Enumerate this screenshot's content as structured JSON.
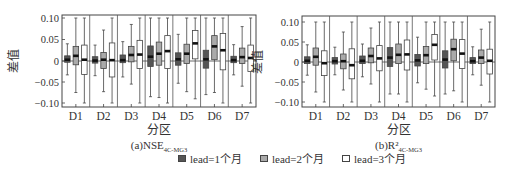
{
  "chart_data": [
    {
      "type": "box",
      "panel": "a",
      "title": "(a)NSE",
      "title_subscript": "4C-MG3",
      "xlabel": "分区",
      "ylabel": "差值",
      "ylim": [
        -0.11,
        0.11
      ],
      "yticks": [
        0.1,
        0.05,
        0,
        -0.05,
        -0.1
      ],
      "ytick_labels": [
        "0.10",
        "0.05",
        "0",
        "−0.05",
        "−0.10"
      ],
      "categories": [
        "D1",
        "D2",
        "D3",
        "D4",
        "D5",
        "D6",
        "D7"
      ],
      "reference_line": 0,
      "series": [
        {
          "name": "lead=1个月",
          "fill": "#555555",
          "boxes": [
            {
              "min": -0.033,
              "q1": -0.003,
              "median": 0.003,
              "q3": 0.012,
              "max": 0.04
            },
            {
              "min": -0.035,
              "q1": -0.005,
              "median": 0.001,
              "q3": 0.01,
              "max": 0.037
            },
            {
              "min": -0.038,
              "q1": -0.004,
              "median": 0.002,
              "q3": 0.014,
              "max": 0.045
            },
            {
              "min": -0.085,
              "q1": -0.013,
              "median": 0.01,
              "q3": 0.035,
              "max": 0.1
            },
            {
              "min": -0.053,
              "q1": -0.01,
              "median": 0.004,
              "q3": 0.019,
              "max": 0.062
            },
            {
              "min": -0.08,
              "q1": -0.017,
              "median": 0.004,
              "q3": 0.025,
              "max": 0.1
            },
            {
              "min": -0.033,
              "q1": -0.004,
              "median": 0.002,
              "q3": 0.011,
              "max": 0.038
            }
          ]
        },
        {
          "name": "lead=2个月",
          "fill": "#aaaaaa",
          "boxes": [
            {
              "min": -0.075,
              "q1": -0.009,
              "median": 0.012,
              "q3": 0.034,
              "max": 0.1
            },
            {
              "min": -0.073,
              "q1": -0.018,
              "median": 0.003,
              "q3": 0.02,
              "max": 0.072
            },
            {
              "min": -0.055,
              "q1": -0.002,
              "median": 0.014,
              "q3": 0.034,
              "max": 0.085
            },
            {
              "min": -0.087,
              "q1": -0.01,
              "median": 0.017,
              "q3": 0.044,
              "max": 0.1
            },
            {
              "min": -0.073,
              "q1": -0.006,
              "median": 0.017,
              "q3": 0.039,
              "max": 0.1
            },
            {
              "min": -0.075,
              "q1": 0.003,
              "median": 0.034,
              "q3": 0.059,
              "max": 0.1
            },
            {
              "min": -0.06,
              "q1": -0.006,
              "median": 0.009,
              "q3": 0.03,
              "max": 0.08
            }
          ]
        },
        {
          "name": "lead=3个月",
          "fill": "#ffffff",
          "boxes": [
            {
              "min": -0.1,
              "q1": -0.032,
              "median": 0.003,
              "q3": 0.037,
              "max": 0.1
            },
            {
              "min": -0.1,
              "q1": -0.038,
              "median": 0.002,
              "q3": 0.042,
              "max": 0.1
            },
            {
              "min": -0.1,
              "q1": -0.018,
              "median": 0.015,
              "q3": 0.048,
              "max": 0.1
            },
            {
              "min": -0.1,
              "q1": -0.018,
              "median": 0.023,
              "q3": 0.059,
              "max": 0.1
            },
            {
              "min": -0.09,
              "q1": 0.005,
              "median": 0.041,
              "q3": 0.071,
              "max": 0.1
            },
            {
              "min": -0.1,
              "q1": -0.021,
              "median": 0.025,
              "q3": 0.064,
              "max": 0.1
            },
            {
              "min": -0.1,
              "q1": -0.025,
              "median": 0.007,
              "q3": 0.037,
              "max": 0.1
            }
          ]
        }
      ]
    },
    {
      "type": "box",
      "panel": "b",
      "title": "(b)R²",
      "title_subscript": "4C-MG3",
      "xlabel": "分区",
      "ylabel": "差值",
      "ylim": [
        -0.11,
        0.11
      ],
      "yticks": [
        0.1,
        0.05,
        0,
        -0.05,
        -0.1
      ],
      "ytick_labels": [
        "0.10",
        "0.05",
        "0",
        "−0.05",
        "−0.10"
      ],
      "categories": [
        "D1",
        "D2",
        "D3",
        "D4",
        "D5",
        "D6",
        "D7"
      ],
      "reference_line": 0,
      "series": [
        {
          "name": "lead=1个月",
          "fill": "#555555",
          "boxes": [
            {
              "min": -0.033,
              "q1": -0.004,
              "median": 0.003,
              "q3": 0.013,
              "max": 0.043
            },
            {
              "min": -0.032,
              "q1": -0.005,
              "median": 0.002,
              "q3": 0.011,
              "max": 0.037
            },
            {
              "min": -0.037,
              "q1": -0.004,
              "median": 0.003,
              "q3": 0.015,
              "max": 0.045
            },
            {
              "min": -0.08,
              "q1": -0.011,
              "median": 0.011,
              "q3": 0.036,
              "max": 0.1
            },
            {
              "min": -0.052,
              "q1": -0.01,
              "median": 0.004,
              "q3": 0.019,
              "max": 0.062
            },
            {
              "min": -0.08,
              "q1": -0.015,
              "median": 0.006,
              "q3": 0.028,
              "max": 0.1
            },
            {
              "min": -0.032,
              "q1": -0.004,
              "median": 0.002,
              "q3": 0.011,
              "max": 0.038
            }
          ]
        },
        {
          "name": "lead=2个月",
          "fill": "#aaaaaa",
          "boxes": [
            {
              "min": -0.075,
              "q1": -0.008,
              "median": 0.013,
              "q3": 0.035,
              "max": 0.1
            },
            {
              "min": -0.07,
              "q1": -0.017,
              "median": 0.002,
              "q3": 0.02,
              "max": 0.075
            },
            {
              "min": -0.055,
              "q1": -0.002,
              "median": 0.015,
              "q3": 0.035,
              "max": 0.085
            },
            {
              "min": -0.08,
              "q1": -0.004,
              "median": 0.018,
              "q3": 0.045,
              "max": 0.1
            },
            {
              "min": -0.068,
              "q1": -0.004,
              "median": 0.017,
              "q3": 0.039,
              "max": 0.1
            },
            {
              "min": -0.072,
              "q1": 0.003,
              "median": 0.032,
              "q3": 0.057,
              "max": 0.1
            },
            {
              "min": -0.058,
              "q1": -0.004,
              "median": 0.011,
              "q3": 0.03,
              "max": 0.082
            }
          ]
        },
        {
          "name": "lead=3个月",
          "fill": "#ffffff",
          "boxes": [
            {
              "min": -0.1,
              "q1": -0.034,
              "median": -0.003,
              "q3": 0.028,
              "max": 0.1
            },
            {
              "min": -0.1,
              "q1": -0.042,
              "median": -0.008,
              "q3": 0.033,
              "max": 0.1
            },
            {
              "min": -0.1,
              "q1": -0.022,
              "median": 0.009,
              "q3": 0.041,
              "max": 0.1
            },
            {
              "min": -0.1,
              "q1": -0.02,
              "median": 0.019,
              "q3": 0.055,
              "max": 0.1
            },
            {
              "min": -0.085,
              "q1": 0.005,
              "median": 0.043,
              "q3": 0.069,
              "max": 0.1
            },
            {
              "min": -0.1,
              "q1": -0.016,
              "median": 0.021,
              "q3": 0.056,
              "max": 0.1
            },
            {
              "min": -0.1,
              "q1": -0.03,
              "median": 0.003,
              "q3": 0.032,
              "max": 0.1
            }
          ]
        }
      ]
    }
  ],
  "legend": {
    "items": [
      {
        "label": "lead=1个月",
        "color": "#555555"
      },
      {
        "label": "lead=2个月",
        "color": "#aaaaaa"
      },
      {
        "label": "lead=3个月",
        "color": "#ffffff"
      }
    ]
  }
}
